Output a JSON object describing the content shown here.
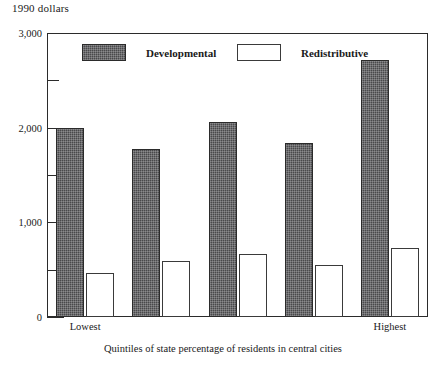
{
  "chart_data": {
    "type": "bar",
    "title": "",
    "ylabel": "1990 dollars",
    "xlabel": "Quintiles of state percentage of residents in central cities",
    "categories": [
      "1",
      "2",
      "3",
      "4",
      "5"
    ],
    "category_labels": {
      "first": "Lowest",
      "last": "Highest"
    },
    "series": [
      {
        "name": "Developmental",
        "values": [
          2000,
          1780,
          2060,
          1840,
          2710
        ],
        "fill": "#49494b",
        "pattern": "dark-hatched"
      },
      {
        "name": "Redistributive",
        "values": [
          470,
          590,
          665,
          550,
          730
        ],
        "fill": "#ffffff",
        "pattern": "open"
      }
    ],
    "ylim": [
      0,
      3000
    ],
    "y_major_ticks": [
      0,
      1000,
      2000,
      3000
    ],
    "y_major_tick_labels": [
      "0",
      "1,000",
      "2,000",
      "3,000"
    ],
    "y_minor_ticks": [
      500,
      1500,
      2500
    ],
    "grid": false,
    "legend_position": "inside-top-left"
  },
  "legend": {
    "items": [
      {
        "label": "Developmental",
        "swatch": "dark-hatched-swatch"
      },
      {
        "label": "Redistributive",
        "swatch": "open-swatch"
      }
    ]
  },
  "axis": {
    "y_title": "1990 dollars",
    "x_caption": "Quintiles of state percentage of residents in central cities",
    "y_tick_labels": [
      "3,000",
      "2,000",
      "1,000",
      "0"
    ],
    "x_tick_labels": [
      "Lowest",
      "Highest"
    ]
  }
}
